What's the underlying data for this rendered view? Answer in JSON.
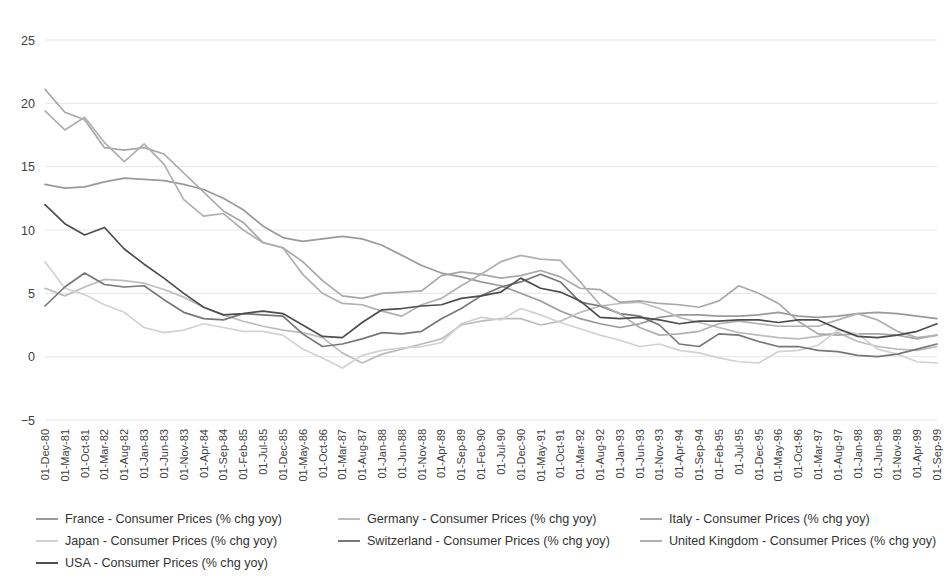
{
  "chart_data": {
    "type": "line",
    "title": "",
    "xlabel": "",
    "ylabel": "",
    "ylim": [
      -5,
      25
    ],
    "yticks": [
      -5,
      0,
      5,
      10,
      15,
      20,
      25
    ],
    "grid": true,
    "legend_position": "bottom",
    "x_tick_step_months": 5,
    "x_start": "01-Dec-80",
    "x_end": "01-Sep-99",
    "tick_labels": [
      "01-Dec-80",
      "01-May-81",
      "01-Oct-81",
      "01-Mar-82",
      "01-Aug-82",
      "01-Jan-83",
      "01-Jun-83",
      "01-Nov-83",
      "01-Apr-84",
      "01-Sep-84",
      "01-Feb-85",
      "01-Jul-85",
      "01-Dec-85",
      "01-May-86",
      "01-Oct-86",
      "01-Mar-87",
      "01-Aug-87",
      "01-Jan-88",
      "01-Jun-88",
      "01-Nov-88",
      "01-Apr-89",
      "01-Sep-89",
      "01-Feb-90",
      "01-Jul-90",
      "01-Dec-90",
      "01-May-91",
      "01-Oct-91",
      "01-Mar-92",
      "01-Aug-92",
      "01-Jan-93",
      "01-Jun-93",
      "01-Nov-93",
      "01-Apr-94",
      "01-Sep-94",
      "01-Feb-95",
      "01-Jul-95",
      "01-Dec-95",
      "01-May-96",
      "01-Oct-96",
      "01-Mar-97",
      "01-Aug-97",
      "01-Jan-98",
      "01-Jun-98",
      "01-Nov-98",
      "01-Apr-99",
      "01-Sep-99"
    ],
    "series": [
      {
        "name": "France - Consumer Prices (% chg yoy)",
        "color": "#9a9a9a",
        "values": [
          13.6,
          13.3,
          13.4,
          13.8,
          14.1,
          14.0,
          13.9,
          13.6,
          13.2,
          12.5,
          11.6,
          10.3,
          9.4,
          9.1,
          9.3,
          9.5,
          9.3,
          8.8,
          8.0,
          7.2,
          6.6,
          6.3,
          5.9,
          5.6,
          5.0,
          4.4,
          3.6,
          3.0,
          2.6,
          2.3,
          2.6,
          3.1,
          3.3,
          3.3,
          3.2,
          3.2,
          3.3,
          3.5,
          3.2,
          3.1,
          3.2,
          3.4,
          3.5,
          3.4,
          3.2,
          3.0
        ]
      },
      {
        "name": "Germany - Consumer Prices (% chg yoy)",
        "color": "#bdbdbd",
        "values": [
          5.4,
          4.8,
          5.5,
          6.1,
          6.0,
          5.8,
          5.3,
          4.7,
          3.9,
          3.3,
          2.8,
          2.4,
          2.1,
          1.9,
          1.5,
          0.3,
          -0.5,
          0.2,
          0.6,
          1.0,
          1.4,
          2.5,
          2.8,
          3.0,
          3.0,
          2.5,
          2.8,
          3.5,
          4.0,
          4.2,
          4.3,
          3.8,
          3.1,
          2.7,
          2.3,
          1.9,
          1.7,
          1.5,
          1.4,
          1.6,
          1.9,
          1.2,
          0.8,
          0.6,
          0.5,
          0.8
        ]
      },
      {
        "name": "Italy - Consumer Prices (% chg yoy)",
        "color": "#a8a8a8",
        "values": [
          21.1,
          19.3,
          18.7,
          16.5,
          16.3,
          16.5,
          16.0,
          14.5,
          13.0,
          11.5,
          10.6,
          9.0,
          8.6,
          7.5,
          6.0,
          4.8,
          4.6,
          5.0,
          5.1,
          5.2,
          6.4,
          6.7,
          6.5,
          6.2,
          6.4,
          6.8,
          6.3,
          5.4,
          5.3,
          4.3,
          4.4,
          4.2,
          4.1,
          3.9,
          4.4,
          5.6,
          5.0,
          4.2,
          2.8,
          1.8,
          1.7,
          1.8,
          1.8,
          1.7,
          1.4,
          1.7
        ]
      },
      {
        "name": "Japan - Consumer Prices (% chg yoy)",
        "color": "#d2d2d2",
        "values": [
          7.5,
          5.4,
          4.9,
          4.1,
          3.5,
          2.3,
          1.9,
          2.1,
          2.6,
          2.3,
          2.0,
          2.0,
          1.7,
          0.6,
          -0.1,
          -0.9,
          0.1,
          0.5,
          0.7,
          0.8,
          1.1,
          2.6,
          3.1,
          2.9,
          3.8,
          3.3,
          2.7,
          2.2,
          1.7,
          1.3,
          0.8,
          1.0,
          0.5,
          0.3,
          -0.1,
          -0.4,
          -0.5,
          0.4,
          0.5,
          0.9,
          2.1,
          1.8,
          0.6,
          0.2,
          -0.4,
          -0.5
        ]
      },
      {
        "name": "Switzerland - Consumer Prices (% chg yoy)",
        "color": "#777777",
        "values": [
          4.0,
          5.5,
          6.6,
          5.7,
          5.5,
          5.6,
          4.5,
          3.5,
          3.0,
          2.9,
          3.4,
          3.3,
          3.2,
          1.8,
          0.8,
          1.0,
          1.4,
          1.9,
          1.8,
          2.0,
          3.0,
          3.8,
          4.8,
          5.5,
          5.9,
          6.5,
          5.9,
          4.3,
          4.0,
          3.4,
          3.2,
          2.5,
          1.0,
          0.8,
          1.8,
          1.7,
          1.2,
          0.8,
          0.8,
          0.5,
          0.4,
          0.1,
          0.0,
          0.2,
          0.6,
          1.0
        ]
      },
      {
        "name": "United Kingdom - Consumer Prices (% chg yoy)",
        "color": "#b0b0b0",
        "values": [
          19.4,
          17.9,
          18.9,
          16.9,
          15.4,
          16.8,
          15.2,
          12.4,
          11.1,
          11.3,
          10.0,
          9.0,
          8.6,
          6.5,
          5.0,
          4.2,
          4.1,
          3.6,
          3.2,
          4.1,
          4.6,
          5.6,
          6.5,
          7.5,
          8.0,
          7.7,
          7.6,
          5.9,
          4.1,
          3.4,
          2.3,
          1.7,
          1.8,
          2.0,
          2.6,
          2.8,
          2.6,
          2.4,
          2.4,
          2.4,
          2.9,
          3.4,
          2.9,
          2.0,
          1.5,
          1.7
        ]
      },
      {
        "name": "USA - Consumer Prices (% chg yoy)",
        "color": "#4d4d4d",
        "values": [
          12.0,
          10.5,
          9.6,
          10.2,
          8.5,
          7.3,
          6.2,
          5.0,
          3.9,
          3.3,
          3.4,
          3.6,
          3.4,
          2.5,
          1.6,
          1.5,
          2.7,
          3.7,
          3.8,
          4.0,
          4.1,
          4.6,
          4.8,
          5.1,
          6.2,
          5.4,
          5.1,
          4.4,
          3.1,
          3.0,
          3.1,
          2.9,
          2.6,
          2.8,
          2.8,
          2.9,
          2.9,
          2.7,
          2.9,
          2.9,
          2.2,
          1.6,
          1.5,
          1.7,
          2.0,
          2.6
        ]
      }
    ]
  }
}
